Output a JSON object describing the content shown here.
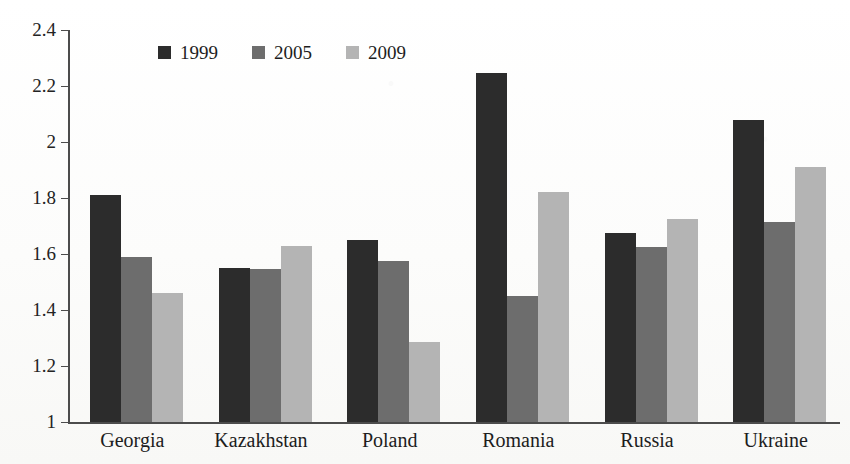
{
  "chart_data": {
    "type": "bar",
    "title": "",
    "subtitle": "",
    "xlabel": "",
    "ylabel": "",
    "categories": [
      "Georgia",
      "Kazakhstan",
      "Poland",
      "Romania",
      "Russia",
      "Ukraine"
    ],
    "series": [
      {
        "name": "1999",
        "color": "#2c2c2c",
        "values": [
          1.81,
          1.55,
          1.65,
          2.245,
          1.675,
          2.08
        ]
      },
      {
        "name": "2005",
        "color": "#6d6d6d",
        "values": [
          1.59,
          1.545,
          1.575,
          1.45,
          1.625,
          1.715
        ]
      },
      {
        "name": "2009",
        "color": "#b4b4b4",
        "values": [
          1.46,
          1.63,
          1.285,
          1.82,
          1.725,
          1.91
        ]
      }
    ],
    "ylim": [
      1,
      2.4
    ],
    "ytick_labels": [
      "2.4",
      "2.2",
      "2",
      "1.8",
      "1.6",
      "1.4",
      "1.2",
      "1"
    ],
    "ytick_values": [
      2.4,
      2.2,
      2.0,
      1.8,
      1.6,
      1.4,
      1.2,
      1.0
    ],
    "grid": false,
    "legend_position": "top-left-inside",
    "legend_entries": [
      "1999",
      "2005",
      "2009"
    ]
  }
}
